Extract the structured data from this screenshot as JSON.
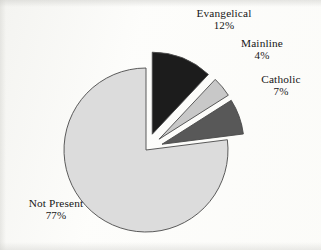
{
  "figure": {
    "background_color": "#fdfdfb",
    "text_color": "#161616",
    "outline_color": "#4a4a4a"
  },
  "chart_data": {
    "type": "pie",
    "title": "",
    "subtitle": "",
    "xlabel": "",
    "ylabel": "",
    "legend_position": "none",
    "grid": false,
    "labels_inline": true,
    "total_percent": 100,
    "categories": [
      "Evangelical",
      "Mainline",
      "Catholic",
      "Not Present"
    ],
    "values": [
      12,
      4,
      7,
      77
    ],
    "value_unit": "%",
    "slices": [
      {
        "name": "Evangelical",
        "value": 12,
        "value_label": "12%",
        "color": "#1c1c1c",
        "exploded": true,
        "start_angle_deg": 0,
        "end_angle_deg": 43.2
      },
      {
        "name": "Mainline",
        "value": 4,
        "value_label": "4%",
        "color": "#c8c8c8",
        "exploded": true,
        "start_angle_deg": 43.2,
        "end_angle_deg": 57.6
      },
      {
        "name": "Catholic",
        "value": 7,
        "value_label": "7%",
        "color": "#585858",
        "exploded": true,
        "start_angle_deg": 57.6,
        "end_angle_deg": 82.8
      },
      {
        "name": "Not Present",
        "value": 77,
        "value_label": "77%",
        "color": "#dcdcdc",
        "exploded": false,
        "start_angle_deg": 82.8,
        "end_angle_deg": 360
      }
    ]
  },
  "labels": {
    "evangelical": {
      "name": "Evangelical",
      "percent": "12%"
    },
    "mainline": {
      "name": "Mainline",
      "percent": "4%"
    },
    "catholic": {
      "name": "Catholic",
      "percent": "7%"
    },
    "not_present": {
      "name": "Not Present",
      "percent": "77%"
    }
  }
}
